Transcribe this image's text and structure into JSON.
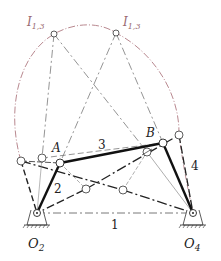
{
  "diagram": {
    "type": "four-bar linkage with instant center locus",
    "labels": {
      "ic_left": "I",
      "ic_left_sub": "1,3",
      "ic_right": "I",
      "ic_right_sub": "1,3",
      "joint_a": "A",
      "joint_b": "B",
      "ground_left": "O",
      "ground_left_sub": "2",
      "ground_right": "O",
      "ground_right_sub": "4",
      "link_1": "1",
      "link_2": "2",
      "link_3": "3",
      "link_4": "4"
    },
    "colors": {
      "link": "#111111",
      "construction": "#555555",
      "locus": "#b07a82",
      "ic_text": "#9a6a72"
    }
  }
}
